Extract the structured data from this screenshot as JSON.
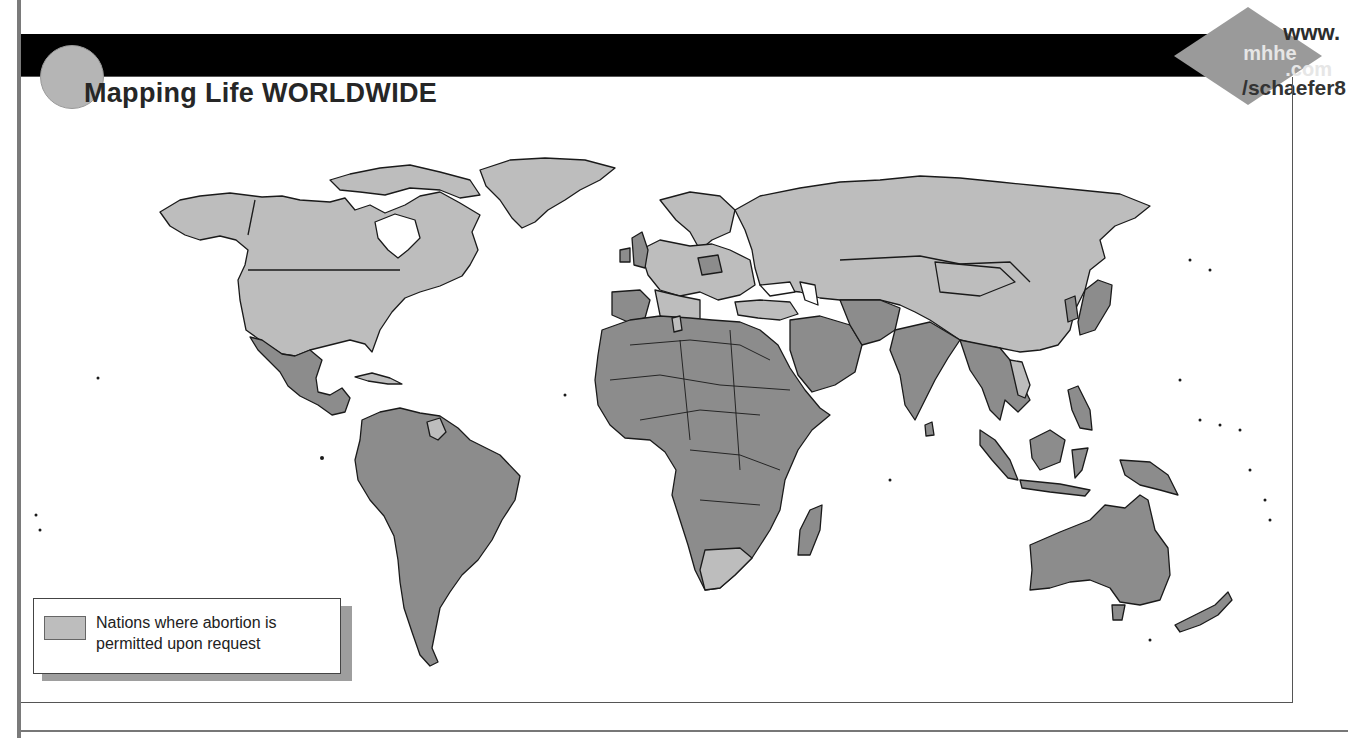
{
  "header": {
    "title": "Mapping Life WORLDWIDE"
  },
  "url_badge": {
    "line1": "www.",
    "line2": "mhhe",
    "line3": ".com",
    "line4": "/schaefer8"
  },
  "legend": {
    "label": "Nations where abortion is permitted upon request",
    "swatch_color": "#bdbdbd"
  },
  "map": {
    "colors": {
      "permitted": "#bdbdbd",
      "not_permitted": "#8c8c8c",
      "water": "#ffffff",
      "border": "#1a1a1a"
    },
    "permitted_regions": [
      "United States",
      "Canada",
      "Greenland",
      "Russia",
      "China",
      "Mongolia",
      "Central Asia",
      "Europe (most)",
      "Turkey",
      "Tunisia",
      "South Africa",
      "Guyana",
      "Cuba",
      "Vietnam",
      "North Korea",
      "Cambodia"
    ],
    "not_permitted_regions": [
      "Mexico",
      "Central America",
      "South America",
      "Africa (most)",
      "Middle East",
      "India",
      "Southeast Asia",
      "Indonesia",
      "Australia",
      "New Zealand",
      "Japan",
      "Ireland",
      "Poland",
      "Spain",
      "United Kingdom"
    ]
  }
}
